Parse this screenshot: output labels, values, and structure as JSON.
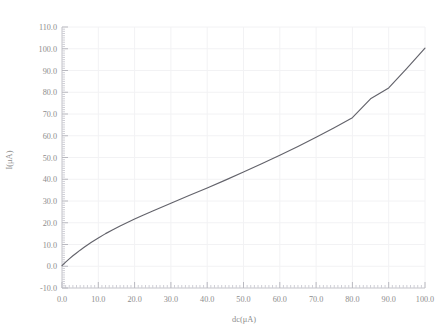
{
  "chart_data": {
    "type": "line",
    "title": "",
    "xlabel": "dc(μA)",
    "ylabel": "I(μA)",
    "xlim": [
      0.0,
      100.0
    ],
    "ylim": [
      -10.0,
      110.0
    ],
    "grid": true,
    "legend": "none",
    "xticks": [
      "0.0",
      "10.0",
      "20.0",
      "30.0",
      "40.0",
      "50.0",
      "60.0",
      "70.0",
      "80.0",
      "90.0",
      "100.0"
    ],
    "xtick_values": [
      0,
      10,
      20,
      30,
      40,
      50,
      60,
      70,
      80,
      90,
      100
    ],
    "yticks": [
      "-10.0",
      "0.0",
      "10.0",
      "20.0",
      "30.0",
      "40.0",
      "50.0",
      "60.0",
      "70.0",
      "80.0",
      "90.0",
      "100.0",
      "110.0"
    ],
    "ytick_values": [
      -10,
      0,
      10,
      20,
      30,
      40,
      50,
      60,
      70,
      80,
      90,
      100,
      110
    ],
    "minor_ticks_per_major": 10,
    "series": [
      {
        "name": "I",
        "color": "#63636b",
        "x": [
          0,
          1,
          2,
          3,
          4,
          5,
          6,
          7,
          8,
          9,
          10,
          12,
          14,
          16,
          18,
          20,
          22,
          25,
          30,
          35,
          40,
          45,
          50,
          55,
          60,
          65,
          70,
          75,
          80,
          85,
          90,
          95,
          100
        ],
        "values": [
          0.3,
          1.9,
          3.4,
          4.8,
          6.1,
          7.4,
          8.6,
          9.8,
          10.9,
          12.0,
          13.0,
          15.0,
          16.8,
          18.5,
          20.1,
          21.7,
          23.2,
          25.4,
          29.0,
          32.5,
          36.0,
          39.6,
          43.3,
          47.1,
          51.0,
          55.1,
          59.3,
          63.7,
          68.3,
          77.0,
          82.0,
          91.0,
          100.3
        ]
      }
    ]
  },
  "plot": {
    "left_px": 62,
    "right_px": 425,
    "top_px": 27,
    "bottom_px": 288
  }
}
